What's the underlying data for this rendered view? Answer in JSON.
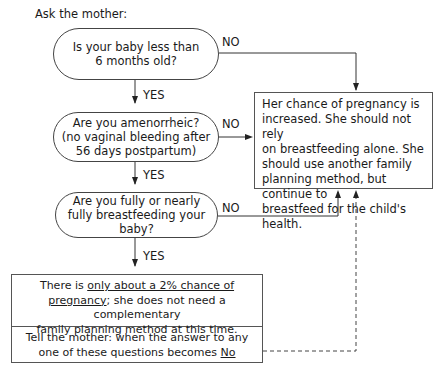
{
  "title": "Ask the mother:",
  "questions": [
    {
      "line1": "Is your baby less than",
      "line2": "6 months old?",
      "line3": ""
    },
    {
      "line1": "Are you amenorrheic?",
      "line2": "(no vaginal bleeding after",
      "line3": "56 days postpartum)"
    },
    {
      "line1": "Are you fully or nearly",
      "line2": "fully breastfeeding your baby?",
      "line3": ""
    }
  ],
  "labels": {
    "yes": "YES",
    "no": "NO"
  },
  "outcome_no": {
    "lines": [
      "Her chance of pregnancy is",
      "increased. She should not rely",
      "on breastfeeding alone. She",
      "should use another family",
      "planning method, but continue to",
      "breastfeed for the child's health."
    ]
  },
  "outcome_yes": {
    "pre": "There is ",
    "underlined1": "only about a 2% chance of",
    "underlined2": "pregnancy",
    "post": "; she does not need a complementary",
    "line3": "family planning method at this time."
  },
  "advice": {
    "line1": "Tell the mother:  when the answer to any",
    "line2_pre": "one of these questions becomes ",
    "line2_underlined": "No"
  }
}
